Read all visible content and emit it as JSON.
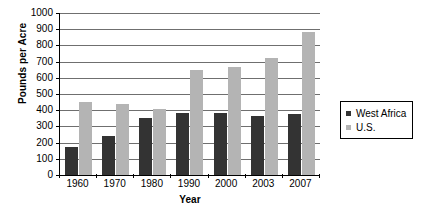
{
  "chart_data": {
    "type": "bar",
    "title": "",
    "xlabel": "Year",
    "ylabel": "Pounds per Acre",
    "categories": [
      "1960",
      "1970",
      "1980",
      "1990",
      "2000",
      "2003",
      "2007"
    ],
    "series": [
      {
        "name": "West Africa",
        "color": "#333333",
        "values": [
          175,
          240,
          355,
          385,
          380,
          365,
          375
        ]
      },
      {
        "name": "U.S.",
        "color": "#b4b4b4",
        "values": [
          450,
          440,
          410,
          650,
          665,
          720,
          880
        ]
      }
    ],
    "ylim": [
      0,
      1000
    ],
    "ytick_step": 100,
    "yticks": [
      "0",
      "100",
      "200",
      "300",
      "400",
      "500",
      "600",
      "700",
      "800",
      "900",
      "1000"
    ],
    "grid": true,
    "grid_axis": "y",
    "legend_position": "right"
  },
  "legend": {
    "entries": [
      {
        "label": "West Africa",
        "color": "#333333"
      },
      {
        "label": "U.S.",
        "color": "#b4b4b4"
      }
    ]
  },
  "axes": {
    "y_title": "Pounds per Acre",
    "x_title": "Year"
  }
}
